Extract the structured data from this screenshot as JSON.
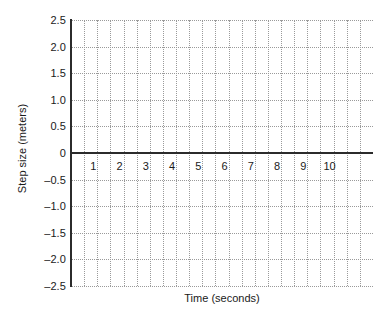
{
  "chart_data": {
    "type": "line",
    "title": "",
    "subtitle": "",
    "xlabel": "Time (seconds)",
    "ylabel": "Step size (meters)",
    "xlim": [
      0,
      11.5
    ],
    "ylim": [
      -2.5,
      2.5
    ],
    "grid": true,
    "legend": null,
    "series": [],
    "annotations": [],
    "x_ticks": [
      {
        "value": 1,
        "label": "1"
      },
      {
        "value": 2,
        "label": "2"
      },
      {
        "value": 3,
        "label": "3"
      },
      {
        "value": 4,
        "label": "4"
      },
      {
        "value": 5,
        "label": "5"
      },
      {
        "value": 6,
        "label": "6"
      },
      {
        "value": 7,
        "label": "7"
      },
      {
        "value": 8,
        "label": "8"
      },
      {
        "value": 9,
        "label": "9"
      },
      {
        "value": 10,
        "label": "10"
      }
    ],
    "y_ticks": [
      {
        "value": 2.5,
        "label": "2.5"
      },
      {
        "value": 2.0,
        "label": "2.0"
      },
      {
        "value": 1.5,
        "label": "1.5"
      },
      {
        "value": 1.0,
        "label": "1.0"
      },
      {
        "value": 0.5,
        "label": "0.5"
      },
      {
        "value": 0,
        "label": "0"
      },
      {
        "value": -0.5,
        "label": "–0.5"
      },
      {
        "value": -1.0,
        "label": "–1.0"
      },
      {
        "value": -1.5,
        "label": "–1.5"
      },
      {
        "value": -2.0,
        "label": "–2.0"
      },
      {
        "value": -2.5,
        "label": "–2.5"
      }
    ],
    "x_gridlines": [
      0.5,
      1,
      1.5,
      2,
      2.5,
      3,
      3.5,
      4,
      4.5,
      5,
      5.5,
      6,
      6.5,
      7,
      7.5,
      8,
      8.5,
      9,
      9.5,
      10,
      10.5,
      11
    ],
    "y_gridlines": [
      2.5,
      2.0,
      1.5,
      1.0,
      0.5,
      -0.5,
      -1.0,
      -1.5,
      -2.0,
      -2.5
    ],
    "colors": {
      "axis": "#2b2b2b",
      "grid": "#9a9a9a",
      "text": "#1a1a1a",
      "background": "#ffffff"
    }
  }
}
